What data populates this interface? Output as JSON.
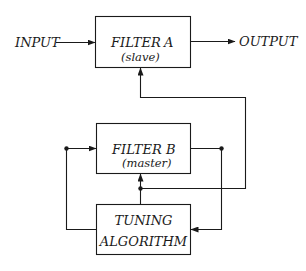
{
  "diagram": {
    "colors": {
      "line": "#1a1a1a",
      "background": "#ffffff"
    },
    "labels": {
      "input": "INPUT",
      "output": "OUTPUT"
    },
    "blocks": {
      "filter_a": {
        "title": "FILTER",
        "letter": "A",
        "subtitle": "(slave)"
      },
      "filter_b": {
        "title": "FILTER",
        "letter": "B",
        "subtitle": "(master)"
      },
      "tuning": {
        "line1": "TUNING",
        "line2": "ALGORITHM"
      }
    }
  }
}
